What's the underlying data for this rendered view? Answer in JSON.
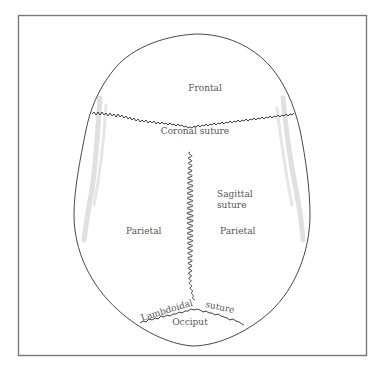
{
  "figure": {
    "type": "anatomical-diagram",
    "labels": {
      "frontal": "Frontal",
      "coronal_suture": "Coronal suture",
      "sagittal_line1": "Sagittal",
      "sagittal_line2": "suture",
      "parietal_left": "Parietal",
      "parietal_right": "Parietal",
      "lambdoidal": "Lambdoidal",
      "lambdoidal_suture": "suture",
      "occiput": "Occiput"
    },
    "colors": {
      "frame": "#7a7a7a",
      "outline": "#333333",
      "label": "#555555",
      "shading": "#d8d8d8"
    }
  }
}
